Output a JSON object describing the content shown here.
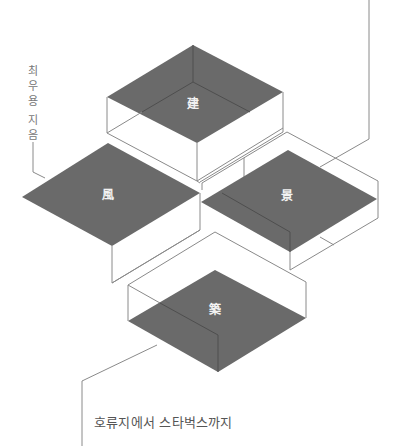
{
  "diagram": {
    "type": "isometric-boxes",
    "colors": {
      "face": "#6a6a6a",
      "edge": "#8a8a8a",
      "glyph": "#f2f2f2",
      "text": "#555555"
    },
    "blocks": [
      {
        "id": "top",
        "glyph": "建",
        "meaning": "architecture (geon)"
      },
      {
        "id": "left",
        "glyph": "風",
        "meaning": "wind (pung)"
      },
      {
        "id": "right",
        "glyph": "景",
        "meaning": "scenery (gyeong)"
      },
      {
        "id": "bottom",
        "glyph": "築",
        "meaning": "build (chuk)"
      }
    ]
  },
  "labels": {
    "author_vertical": [
      "최",
      "우",
      "용",
      " ",
      "지",
      "음"
    ],
    "caption": "호류지에서 스타벅스까지"
  }
}
